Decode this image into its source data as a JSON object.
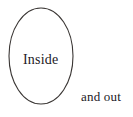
{
  "figure": {
    "background_color": "#ffffff",
    "stroke_color": "#3a3634",
    "text_color": "#23201f"
  },
  "shape": {
    "kind": "ellipse",
    "center_x": 41,
    "center_y": 56,
    "radius_x": 32,
    "radius_y": 48,
    "stroke_width": 1.1,
    "fill": "none"
  },
  "labels": {
    "inside": "Inside",
    "outside": "and out"
  }
}
